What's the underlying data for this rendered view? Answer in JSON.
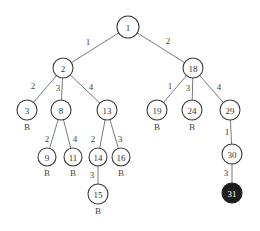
{
  "diagram": {
    "type": "search-tree",
    "nodes": [
      {
        "id": "1",
        "label": "1",
        "x": 128,
        "y": 27,
        "r": 11,
        "marker": "",
        "goal": false
      },
      {
        "id": "2",
        "label": "2",
        "x": 63,
        "y": 68,
        "r": 10,
        "marker": "",
        "goal": false
      },
      {
        "id": "18",
        "label": "18",
        "x": 193,
        "y": 68,
        "r": 10,
        "marker": "",
        "goal": false
      },
      {
        "id": "3",
        "label": "3",
        "x": 27,
        "y": 110,
        "r": 10,
        "marker": "B",
        "goal": false
      },
      {
        "id": "8",
        "label": "8",
        "x": 61,
        "y": 110,
        "r": 10,
        "marker": "",
        "goal": false
      },
      {
        "id": "13",
        "label": "13",
        "x": 107,
        "y": 110,
        "r": 10,
        "marker": "",
        "goal": false
      },
      {
        "id": "19",
        "label": "19",
        "x": 157,
        "y": 110,
        "r": 10,
        "marker": "B",
        "goal": false
      },
      {
        "id": "24",
        "label": "24",
        "x": 192,
        "y": 110,
        "r": 10,
        "marker": "B",
        "goal": false
      },
      {
        "id": "29",
        "label": "29",
        "x": 230,
        "y": 110,
        "r": 10,
        "marker": "",
        "goal": false
      },
      {
        "id": "9",
        "label": "9",
        "x": 47,
        "y": 157,
        "r": 9,
        "marker": "B",
        "goal": false
      },
      {
        "id": "11",
        "label": "11",
        "x": 73,
        "y": 157,
        "r": 9,
        "marker": "B",
        "goal": false
      },
      {
        "id": "14",
        "label": "14",
        "x": 98,
        "y": 157,
        "r": 9,
        "marker": "",
        "goal": false
      },
      {
        "id": "16",
        "label": "16",
        "x": 121,
        "y": 157,
        "r": 9,
        "marker": "B",
        "goal": false
      },
      {
        "id": "30",
        "label": "30",
        "x": 232,
        "y": 154,
        "r": 10,
        "marker": "",
        "goal": false
      },
      {
        "id": "15",
        "label": "15",
        "x": 98,
        "y": 194,
        "r": 10,
        "marker": "B",
        "goal": false
      },
      {
        "id": "31",
        "label": "31",
        "x": 232,
        "y": 193,
        "r": 10,
        "marker": "",
        "goal": true
      }
    ],
    "edges": [
      {
        "from": "1",
        "to": "2",
        "label": "1",
        "lx": 88,
        "ly": 42
      },
      {
        "from": "1",
        "to": "18",
        "label": "2",
        "lx": 168,
        "ly": 41
      },
      {
        "from": "2",
        "to": "3",
        "label": "2",
        "lx": 33,
        "ly": 86
      },
      {
        "from": "2",
        "to": "8",
        "label": "3",
        "lx": 58,
        "ly": 88
      },
      {
        "from": "2",
        "to": "13",
        "label": "4",
        "lx": 91,
        "ly": 87
      },
      {
        "from": "18",
        "to": "19",
        "label": "1",
        "lx": 170,
        "ly": 86
      },
      {
        "from": "18",
        "to": "24",
        "label": "3",
        "lx": 188,
        "ly": 88
      },
      {
        "from": "18",
        "to": "29",
        "label": "4",
        "lx": 219,
        "ly": 87
      },
      {
        "from": "8",
        "to": "9",
        "label": "2",
        "lx": 47,
        "ly": 139
      },
      {
        "from": "8",
        "to": "11",
        "label": "4",
        "lx": 75,
        "ly": 139
      },
      {
        "from": "13",
        "to": "14",
        "label": "2",
        "lx": 93,
        "ly": 139
      },
      {
        "from": "13",
        "to": "16",
        "label": "3",
        "lx": 120,
        "ly": 139
      },
      {
        "from": "14",
        "to": "15",
        "label": "3",
        "lx": 92,
        "ly": 175
      },
      {
        "from": "29",
        "to": "30",
        "label": "1",
        "lx": 227,
        "ly": 132
      },
      {
        "from": "30",
        "to": "31",
        "label": "3",
        "lx": 226,
        "ly": 173
      }
    ],
    "colors": {
      "node_fill": "#ffffff",
      "node_stroke": "#3a3a3a",
      "goal_fill": "#1e1e1e",
      "goal_text": "#ffffff",
      "edge": "#6a6a6a",
      "text": "#333333"
    }
  }
}
